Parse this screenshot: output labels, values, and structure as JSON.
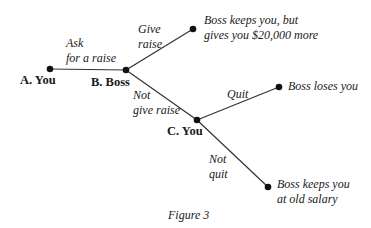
{
  "diagram": {
    "nodes": {
      "a": {
        "label": "A. You"
      },
      "b": {
        "label": "B. Boss"
      },
      "c": {
        "label": "C. You"
      }
    },
    "edges": {
      "ask": {
        "line1": "Ask",
        "line2": "for a raise"
      },
      "give": {
        "line1": "Give",
        "line2": "raise"
      },
      "not_give": {
        "line1": "Not",
        "line2": "give raise"
      },
      "quit": {
        "label": "Quit"
      },
      "not_quit": {
        "line1": "Not",
        "line2": "quit"
      }
    },
    "outcomes": {
      "raise": {
        "line1": "Boss keeps you, but",
        "line2": "gives you $20,000 more"
      },
      "loses": {
        "label": "Boss loses you"
      },
      "old_salary": {
        "line1": "Boss keeps you",
        "line2": "at old salary"
      }
    },
    "caption": "Figure 3"
  }
}
